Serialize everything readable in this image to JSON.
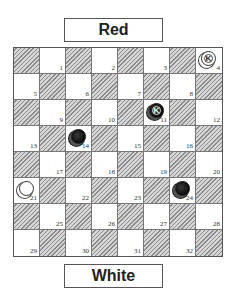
{
  "labels": {
    "top": "Red",
    "bottom": "White"
  },
  "colors": {
    "dark_square": "#c8c8c8",
    "hatch_line": "#8a8a8a",
    "light_square": "#ffffff",
    "red_piece": "#111111",
    "white_piece": "#ffffff"
  },
  "board": {
    "rows": 8,
    "cols": 8,
    "top_left_dark": true,
    "squares": [
      {
        "num": "1"
      },
      {
        "num": "2"
      },
      {
        "num": "3"
      },
      {
        "num": "4"
      },
      {
        "num": "5"
      },
      {
        "num": "6"
      },
      {
        "num": "7"
      },
      {
        "num": "8"
      },
      {
        "num": "9"
      },
      {
        "num": "10"
      },
      {
        "num": "11"
      },
      {
        "num": "12"
      },
      {
        "num": "13"
      },
      {
        "num": "14"
      },
      {
        "num": "15"
      },
      {
        "num": "16"
      },
      {
        "num": "17"
      },
      {
        "num": "18"
      },
      {
        "num": "19"
      },
      {
        "num": "20"
      },
      {
        "num": "21"
      },
      {
        "num": "22"
      },
      {
        "num": "23"
      },
      {
        "num": "24"
      },
      {
        "num": "25"
      },
      {
        "num": "26"
      },
      {
        "num": "27"
      },
      {
        "num": "28"
      },
      {
        "num": "29"
      },
      {
        "num": "30"
      },
      {
        "num": "31"
      },
      {
        "num": "32"
      }
    ]
  },
  "pieces": [
    {
      "square": 4,
      "color": "white",
      "king": true,
      "mark": "K"
    },
    {
      "square": 11,
      "color": "red",
      "king": true,
      "mark": "K"
    },
    {
      "square": 14,
      "color": "red",
      "king": false,
      "mark": ""
    },
    {
      "square": 21,
      "color": "white",
      "king": false,
      "mark": ""
    },
    {
      "square": 24,
      "color": "red",
      "king": false,
      "mark": ""
    }
  ]
}
